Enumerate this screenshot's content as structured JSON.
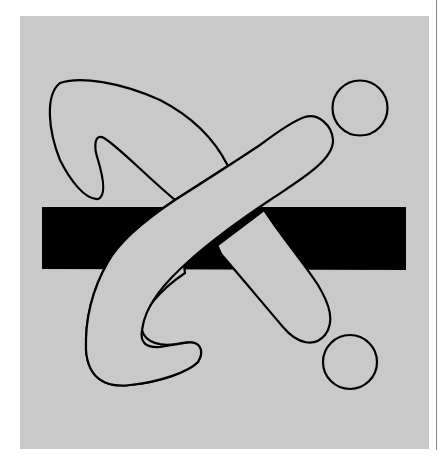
{
  "artwork": {
    "description": "Abstract line art: a boomerang-like loop and a rounded bar crossing over a black horizontal band, with two small circles on the right",
    "colors": {
      "page_background": "#ffffff",
      "panel": "#c9c9c9",
      "ink": "#000000",
      "edge_line": "#8a8a8a"
    },
    "elements": [
      {
        "name": "gray-panel"
      },
      {
        "name": "black-band"
      },
      {
        "name": "left-loop-shape"
      },
      {
        "name": "diagonal-bar-shape"
      },
      {
        "name": "upper-circle"
      },
      {
        "name": "lower-circle"
      }
    ]
  }
}
